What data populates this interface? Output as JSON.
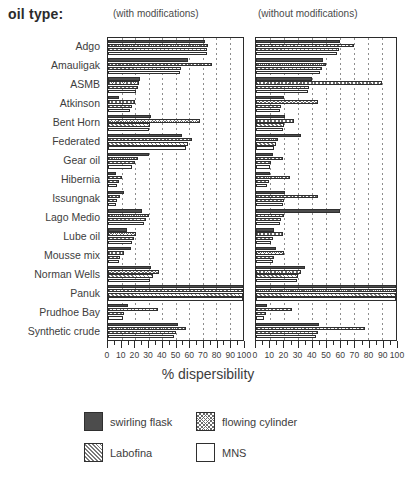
{
  "header": {
    "oil_type_label": "oil type:",
    "panel_left_caption": "(with modifications)",
    "panel_right_caption": "(without modifications)"
  },
  "axis": {
    "title": "% dispersibility",
    "tick_labels": [
      "0",
      "10",
      "20",
      "30",
      "40",
      "50",
      "60",
      "70",
      "80",
      "90",
      "100"
    ]
  },
  "legend": {
    "items": [
      {
        "label": "swirling flask",
        "swatch": "solid-dark-swatch",
        "color": "#4c4c4c"
      },
      {
        "label": "flowing cylinder",
        "swatch": "cross-hatch-swatch",
        "color": "#6b6b6b"
      },
      {
        "label": "Labofina",
        "swatch": "diagonal-hatch-swatch",
        "color": "#7a7a7a"
      },
      {
        "label": "MNS",
        "swatch": "empty-white-swatch",
        "color": "#ffffff"
      }
    ]
  },
  "chart_data": {
    "type": "bar",
    "orientation": "horizontal",
    "title": "",
    "xlabel": "% dispersibility",
    "ylabel": "oil type",
    "xlim": [
      0,
      100
    ],
    "grid": true,
    "grid_axis": "x",
    "legend_position": "bottom",
    "panels": [
      {
        "name": "with modifications",
        "caption": "(with modifications)"
      },
      {
        "name": "without modifications",
        "caption": "(without modifications)"
      }
    ],
    "categories": [
      "Adgo",
      "Amauligak",
      "ASMB",
      "Atkinson",
      "Bent Horn",
      "Federated",
      "Gear oil",
      "Hibernia",
      "Issungnak",
      "Lago Medio",
      "Lube oil",
      "Mousse mix",
      "Norman Wells",
      "Panuk",
      "Prudhoe Bay",
      "Synthetic crude"
    ],
    "series_names": [
      "swirling flask",
      "flowing cylinder",
      "Labofina",
      "MNS"
    ],
    "panel_series": [
      {
        "panel": "with modifications",
        "series": [
          {
            "name": "swirling flask",
            "values": [
              72,
              59,
              24,
              8,
              32,
              55,
              30,
              6,
              12,
              25,
              14,
              17,
              32,
              100,
              15,
              52
            ]
          },
          {
            "name": "flowing cylinder",
            "values": [
              74,
              77,
              23,
              20,
              68,
              62,
              22,
              10,
              9,
              30,
              21,
              12,
              38,
              100,
              37,
              58
            ]
          },
          {
            "name": "Labofina",
            "values": [
              73,
              54,
              22,
              18,
              31,
              59,
              20,
              8,
              7,
              28,
              19,
              9,
              33,
              100,
              12,
              50
            ]
          },
          {
            "name": "MNS",
            "values": [
              73,
              53,
              21,
              16,
              30,
              58,
              18,
              7,
              6,
              27,
              18,
              8,
              31,
              100,
              11,
              49
            ]
          }
        ]
      },
      {
        "panel": "without modifications",
        "series": [
          {
            "name": "swirling flask",
            "values": [
              60,
              48,
              40,
              20,
              21,
              32,
              12,
              10,
              21,
              60,
              13,
              14,
              35,
              100,
              8,
              45
            ]
          },
          {
            "name": "flowing cylinder",
            "values": [
              70,
              50,
              90,
              44,
              27,
              16,
              19,
              24,
              44,
              20,
              19,
              20,
              32,
              100,
              26,
              78
            ]
          },
          {
            "name": "Labofina",
            "values": [
              59,
              47,
              38,
              18,
              20,
              14,
              11,
              9,
              20,
              18,
              12,
              13,
              30,
              100,
              7,
              44
            ]
          },
          {
            "name": "MNS",
            "values": [
              58,
              46,
              37,
              17,
              19,
              13,
              10,
              8,
              19,
              17,
              11,
              12,
              29,
              100,
              6,
              43
            ]
          }
        ]
      }
    ]
  }
}
